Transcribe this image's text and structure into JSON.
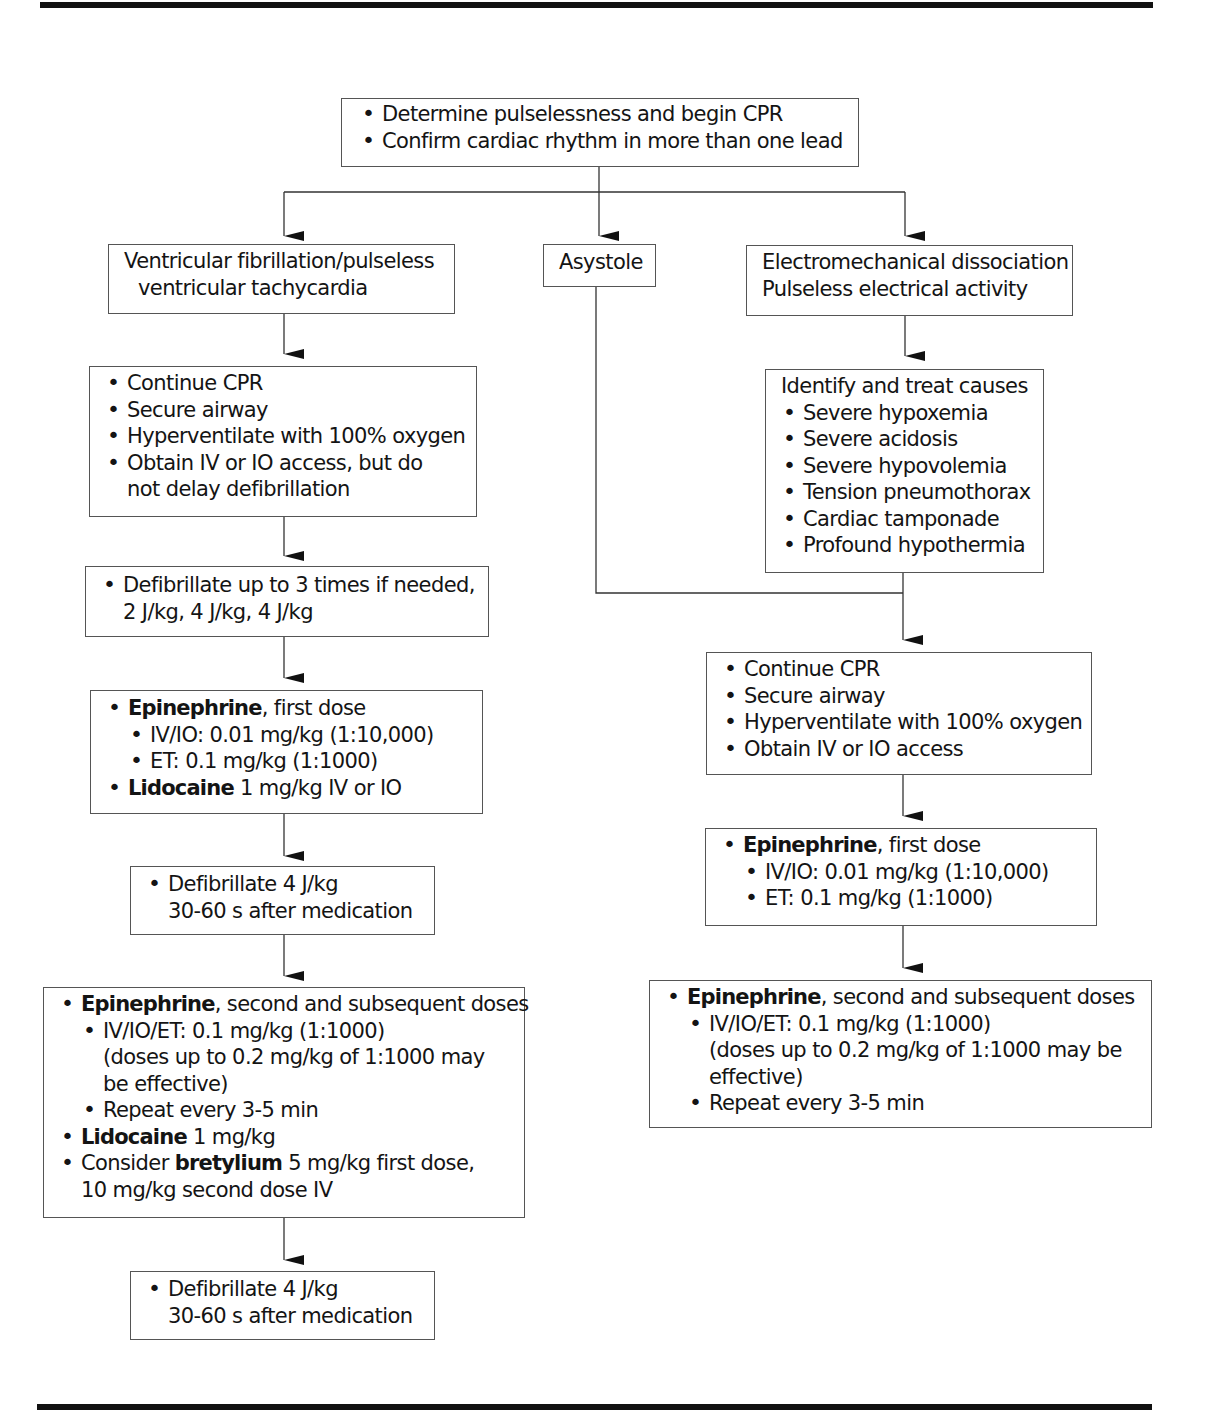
{
  "diagram": {
    "type": "flowchart",
    "start": {
      "items": [
        "Determine pulselessness and begin CPR",
        "Confirm cardiac rhythm in more than one lead"
      ]
    },
    "branches": {
      "vf": {
        "header": [
          "Ventricular fibrillation/pulseless",
          "ventricular tachycardia"
        ],
        "step1": {
          "items": [
            "Continue CPR",
            "Secure airway",
            "Hyperventilate with 100% oxygen",
            "Obtain IV or IO access, but do",
            "not delay defibrillation"
          ]
        },
        "step2": {
          "line1": "Defibrillate up to 3 times if needed,",
          "line2": "2 J/kg, 4 J/kg, 4 J/kg"
        },
        "step3": {
          "epi_drug": "Epinephrine",
          "epi_rest": ", first dose",
          "epi_iv": "IV/IO: 0.01 mg/kg (1:10,000)",
          "epi_et": "ET: 0.1 mg/kg (1:1000)",
          "lido_drug": "Lidocaine",
          "lido_rest": " 1 mg/kg IV or IO"
        },
        "step4": {
          "line1": "Defibrillate 4 J/kg",
          "line2": "30-60 s after medication"
        },
        "step5": {
          "epi_drug": "Epinephrine",
          "epi_rest": ", second and subsequent doses",
          "epi_dose": "IV/IO/ET: 0.1 mg/kg (1:1000)",
          "epi_note1": "(doses up to 0.2 mg/kg of 1:1000 may",
          "epi_note2": "be effective)",
          "repeat": "Repeat every 3-5 min",
          "lido_drug": "Lidocaine",
          "lido_rest": " 1 mg/kg",
          "bret_pre": "Consider ",
          "bret_drug": "bretylium",
          "bret_rest": " 5 mg/kg first dose,",
          "bret_line2": "10 mg/kg second dose IV"
        },
        "step6": {
          "line1": "Defibrillate 4 J/kg",
          "line2": "30-60 s after medication"
        }
      },
      "asystole": {
        "header": "Asystole"
      },
      "pea": {
        "header": [
          "Electromechanical dissociation",
          "Pulseless electrical activity"
        ],
        "causes": {
          "title": "Identify and treat causes",
          "items": [
            "Severe hypoxemia",
            "Severe acidosis",
            "Severe hypovolemia",
            "Tension pneumothorax",
            "Cardiac tamponade",
            "Profound hypothermia"
          ]
        }
      },
      "merged": {
        "step1": {
          "items": [
            "Continue CPR",
            "Secure airway",
            "Hyperventilate with 100% oxygen",
            "Obtain IV or IO access"
          ]
        },
        "step2": {
          "epi_drug": "Epinephrine",
          "epi_rest": ", first dose",
          "epi_iv": "IV/IO: 0.01 mg/kg (1:10,000)",
          "epi_et": "ET: 0.1 mg/kg (1:1000)"
        },
        "step3": {
          "epi_drug": "Epinephrine",
          "epi_rest": ", second and subsequent doses",
          "epi_dose": "IV/IO/ET: 0.1 mg/kg (1:1000)",
          "epi_note1": "(doses up to 0.2 mg/kg of 1:1000 may be",
          "epi_note2": "effective)",
          "repeat": "Repeat every 3-5 min"
        }
      }
    },
    "colors": {
      "line": "#111111",
      "box_border": "#555555",
      "background": "#ffffff"
    }
  }
}
